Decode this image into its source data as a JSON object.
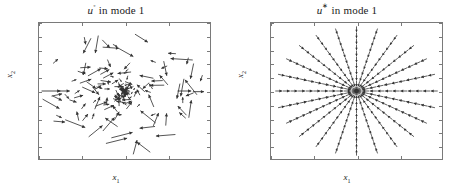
{
  "figure": {
    "background": "#ffffff",
    "axis_color": "#7a7a7a",
    "arrow_color": "#333333"
  },
  "panels": [
    {
      "id": "left",
      "title_symbol": "u",
      "title_superscript": "◦",
      "title_rest": " in mode 1",
      "title_full": "u° in mode 1",
      "xlabel": "x",
      "xlabel_sub": "1",
      "ylabel": "x",
      "ylabel_sub": "2",
      "xticks": [
        "-1",
        "-0.5",
        "0",
        "0.5",
        "1"
      ],
      "xtick_values": [
        -1,
        -0.5,
        0,
        0.5,
        1
      ],
      "yticks": [
        "1",
        "0.8",
        "0.6",
        "0.4",
        "0.2",
        "0",
        "-0.2",
        "-0.4",
        "-0.6",
        "-0.8",
        "-1"
      ],
      "ytick_values": [
        1,
        0.8,
        0.6,
        0.4,
        0.2,
        0,
        -0.2,
        -0.4,
        -0.6,
        -0.8,
        -1
      ]
    },
    {
      "id": "right",
      "title_symbol": "u",
      "title_superscript": "∗",
      "title_rest": " in mode 1",
      "title_full": "u* in mode 1",
      "xlabel": "x",
      "xlabel_sub": "1",
      "ylabel": "x",
      "ylabel_sub": "2",
      "xticks": [
        "-1",
        "-0.5",
        "0",
        "0.5",
        "1"
      ],
      "xtick_values": [
        -1,
        -0.5,
        0,
        0.5,
        1
      ],
      "yticks": [
        "1",
        "0.8",
        "0.6",
        "0.4",
        "0.2",
        "0",
        "-0.2",
        "-0.4",
        "-0.6",
        "-0.8",
        "-1"
      ],
      "ytick_values": [
        1,
        0.8,
        0.6,
        0.4,
        0.2,
        0,
        -0.2,
        -0.4,
        -0.6,
        -0.8,
        -1
      ]
    }
  ],
  "chart_data": [
    {
      "type": "scatter",
      "plot_kind": "quiver",
      "title": "u° in mode 1",
      "xlabel": "x1",
      "ylabel": "x2",
      "xlim": [
        -1,
        1
      ],
      "ylim": [
        -1,
        1
      ],
      "grid": false,
      "legend": null,
      "description": "Noisy, irregularly oriented vector field; arrow density increases near the origin with short random-direction arrows, sparser longer arrows toward the edges.",
      "arrow_count": 170,
      "field_model": "radial_inward_with_strong_noise",
      "noise_angle_deg": 75,
      "noise_length": 0.7,
      "seed": 7
    },
    {
      "type": "scatter",
      "plot_kind": "quiver",
      "title": "u* in mode 1",
      "xlabel": "x1",
      "ylabel": "x2",
      "xlim": [
        -1,
        1
      ],
      "ylim": [
        -1,
        1
      ],
      "grid": false,
      "legend": null,
      "description": "Clean radial star: 24 evenly spaced rays of arrows, each ray pointing inward toward the origin; a small open circle of arrowheads forms at the center.",
      "rays": 24,
      "ray_spacing_deg": 15,
      "arrows_per_ray": 11,
      "radius_min": 0.06,
      "radius_max": 0.95,
      "direction": "inward"
    }
  ]
}
